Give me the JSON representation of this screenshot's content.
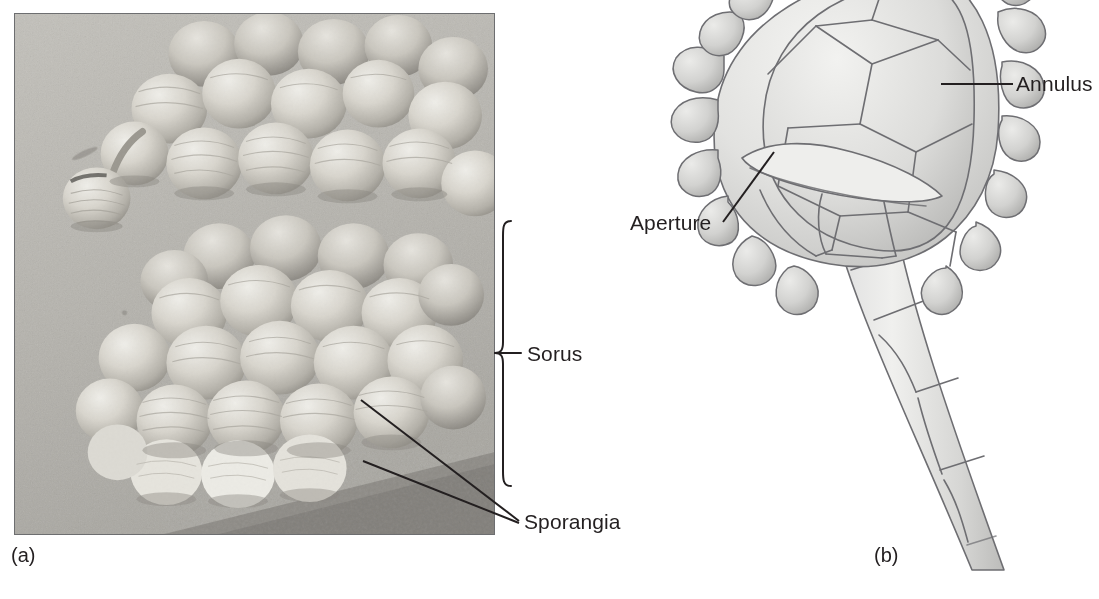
{
  "figure": {
    "type": "biology-textbook-figure",
    "background_color": "#ffffff",
    "ink_color": "#231f20"
  },
  "panels": [
    {
      "id": "a",
      "letter": "(a)",
      "kind": "scanning-electron-micrograph",
      "caption_position": "below-left",
      "description": "Two clusters of rounded, ribbed fern sporangia resting on a granular leaf surface"
    },
    {
      "id": "b",
      "letter": "(b)",
      "kind": "line-drawing",
      "caption_position": "below-left",
      "description": "Single fern sporangium: ovoid capsule with polygonal wall cells, a ring of annulus cells, an aperture, and a long tapering stalk"
    }
  ],
  "labels": [
    {
      "id": "sorus",
      "text": "Sorus",
      "panel": "a",
      "leader": "curly-brace",
      "brace_top_y": 220,
      "brace_bottom_y": 487
    },
    {
      "id": "sporangia",
      "text": "Sporangia",
      "panel": "a",
      "leader": "two-lines",
      "leader_count": 2
    },
    {
      "id": "annulus",
      "text": "Annulus",
      "panel": "b",
      "leader": "horizontal-line"
    },
    {
      "id": "aperture",
      "text": "Aperture",
      "panel": "b",
      "leader": "diagonal-line"
    }
  ],
  "colors": {
    "photo_border": "#6d6e70",
    "photo_base": "#b9b7b2",
    "spore_light": "#e2e0da",
    "spore_mid": "#c6c3bc",
    "spore_shadow": "#8d8a84",
    "dark_band": "#7a7772",
    "drawing_line": "#6e6e72",
    "drawing_fill_light": "#e9e9e7",
    "drawing_fill_mid": "#cfcfcd",
    "leader_line": "#231f20"
  }
}
